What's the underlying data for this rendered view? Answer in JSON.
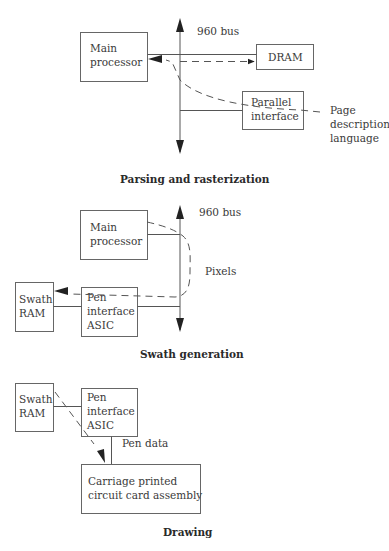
{
  "sections": [
    {
      "title": "Parsing and rasterization",
      "bus_label": "960 bus",
      "boxes": {
        "main_processor": [
          "Main",
          "processor"
        ],
        "dram": [
          "DRAM"
        ],
        "parallel_interface": [
          "Parallel",
          "interface"
        ]
      },
      "external_label": [
        "Page",
        "description",
        "language"
      ]
    },
    {
      "title": "Swath generation",
      "bus_label": "960 bus",
      "boxes": {
        "main_processor": [
          "Main",
          "processor"
        ],
        "swath_ram": [
          "Swath",
          "RAM"
        ],
        "pen_interface_asic": [
          "Pen",
          "interface",
          "ASIC"
        ]
      },
      "flow_label": "Pixels"
    },
    {
      "title": "Drawing",
      "boxes": {
        "swath_ram": [
          "Swath",
          "RAM"
        ],
        "pen_interface_asic": [
          "Pen",
          "interface",
          "ASIC"
        ],
        "carriage": [
          "Carriage printed",
          "circuit card assembly"
        ]
      },
      "flow_label": "Pen data"
    }
  ],
  "colors": {
    "line": "#555555",
    "text": "#3a3a3a",
    "background": "#ffffff"
  }
}
